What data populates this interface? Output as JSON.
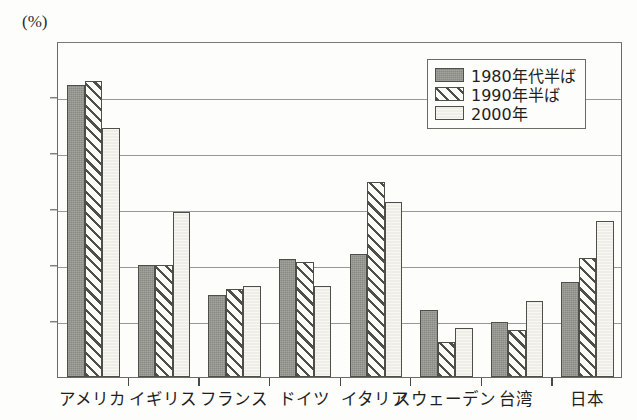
{
  "chart_data": {
    "type": "bar",
    "title": "",
    "subtitle": "",
    "xlabel": "",
    "ylabel": "",
    "unit_label": "(%)",
    "ylim": [
      0.0,
      30.0
    ],
    "ytick_step": 5.0,
    "ytick_labels": [
      "0.0",
      "5.0",
      "10.0",
      "15.0",
      "20.0",
      "25.0",
      "30.0"
    ],
    "ytick_values": [
      0.0,
      5.0,
      10.0,
      15.0,
      20.0,
      25.0,
      30.0
    ],
    "grid": "horizontal",
    "legend_position": "top-right-inside",
    "categories": [
      "アメリカ",
      "イギリス",
      "フランス",
      "ドイツ",
      "イタリア",
      "スウェーデン",
      "台湾",
      "日本"
    ],
    "series": [
      {
        "name": "1980年代半ば",
        "fill": "solid-dark",
        "color": "#8a8a84",
        "values": [
          26.1,
          10.0,
          7.3,
          10.5,
          11.0,
          6.0,
          4.9,
          8.5
        ]
      },
      {
        "name": "1990年半ば",
        "fill": "diagonal-hatch",
        "color": "#4f4f4a",
        "values": [
          26.4,
          10.0,
          7.9,
          10.3,
          17.4,
          3.1,
          4.2,
          10.6
        ]
      },
      {
        "name": "2000年",
        "fill": "solid-light",
        "color": "#eeeee6",
        "values": [
          22.2,
          14.7,
          8.1,
          8.1,
          15.6,
          4.4,
          6.8,
          13.9
        ]
      }
    ]
  },
  "colors": {
    "background": "#fdfdfb",
    "axis": "#6b6b66",
    "grid": "#9a9a94",
    "text": "#1f1f1f",
    "bar_outline": "#4f4f4a"
  }
}
